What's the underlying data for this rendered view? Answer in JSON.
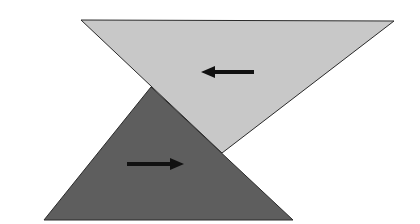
{
  "diagram": {
    "background": "#ffffff",
    "light_triangle": {
      "fill": "#c8c8c8",
      "stroke": "#2a2a2a",
      "points": "81,20 394,21 222,153",
      "orientation": "inverted",
      "arrow": {
        "direction": "left",
        "x1": 254,
        "y1": 72,
        "x2": 201,
        "y2": 72,
        "color": "#111111"
      }
    },
    "dark_triangle": {
      "fill": "#5e5e5e",
      "stroke": "#2a2a2a",
      "points": "151,87 293,220 44,220",
      "orientation": "upright",
      "arrow": {
        "direction": "right",
        "x1": 127,
        "y1": 164,
        "x2": 184,
        "y2": 164,
        "color": "#111111"
      }
    }
  }
}
